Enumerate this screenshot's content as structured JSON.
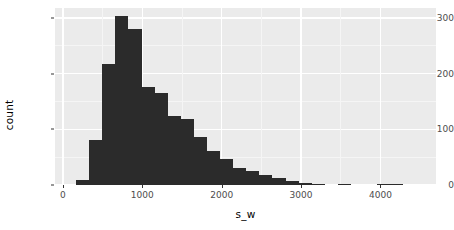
{
  "chart_data": {
    "type": "bar",
    "subtype": "histogram",
    "title": "",
    "xlabel": "s_w",
    "ylabel": "count",
    "xlim": [
      -100,
      4700
    ],
    "ylim": [
      0,
      318
    ],
    "grid": true,
    "legend": null,
    "binwidth": 165,
    "x_ticks": [
      0,
      1000,
      2000,
      3000,
      4000
    ],
    "x_tick_labels": [
      "0",
      "1000",
      "2000",
      "3000",
      "4000"
    ],
    "y_ticks": [
      0,
      100,
      200,
      300
    ],
    "y_tick_labels": [
      "0",
      "100",
      "200",
      "300"
    ],
    "bar_color": "#2b2b2b",
    "panel_color": "#ebebeb",
    "grid_color": "#ffffff",
    "bins": [
      {
        "x0": 165,
        "x1": 330,
        "count": 9
      },
      {
        "x0": 330,
        "x1": 495,
        "count": 80
      },
      {
        "x0": 495,
        "x1": 660,
        "count": 218
      },
      {
        "x0": 660,
        "x1": 825,
        "count": 304
      },
      {
        "x0": 825,
        "x1": 990,
        "count": 281
      },
      {
        "x0": 990,
        "x1": 1155,
        "count": 176
      },
      {
        "x0": 1155,
        "x1": 1320,
        "count": 165
      },
      {
        "x0": 1320,
        "x1": 1485,
        "count": 124
      },
      {
        "x0": 1485,
        "x1": 1650,
        "count": 118
      },
      {
        "x0": 1650,
        "x1": 1815,
        "count": 86
      },
      {
        "x0": 1815,
        "x1": 1980,
        "count": 62
      },
      {
        "x0": 1980,
        "x1": 2145,
        "count": 46
      },
      {
        "x0": 2145,
        "x1": 2310,
        "count": 30
      },
      {
        "x0": 2310,
        "x1": 2475,
        "count": 25
      },
      {
        "x0": 2475,
        "x1": 2640,
        "count": 18
      },
      {
        "x0": 2640,
        "x1": 2805,
        "count": 12
      },
      {
        "x0": 2805,
        "x1": 2970,
        "count": 8
      },
      {
        "x0": 2970,
        "x1": 3135,
        "count": 3
      },
      {
        "x0": 3135,
        "x1": 3300,
        "count": 1
      },
      {
        "x0": 3465,
        "x1": 3630,
        "count": 1
      },
      {
        "x0": 3960,
        "x1": 4125,
        "count": 1
      },
      {
        "x0": 4125,
        "x1": 4290,
        "count": 1
      }
    ],
    "minor_y_gridlines": [
      50,
      150,
      250
    ],
    "minor_x_gridlines": [
      500,
      1500,
      2500,
      3500
    ]
  }
}
